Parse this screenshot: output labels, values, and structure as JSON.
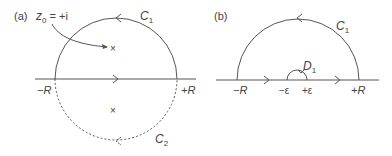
{
  "panel_a": {
    "tag": "(a)",
    "pole_label": "z",
    "pole_sub": "0",
    "pole_value": " = +i",
    "upper_contour": "C",
    "upper_sub": "1",
    "lower_contour": "C",
    "lower_sub": "2",
    "left_end": "−R",
    "right_end": "+R",
    "pole_mark": "×"
  },
  "panel_b": {
    "tag": "(b)",
    "upper_contour": "C",
    "upper_sub": "1",
    "indent_contour": "D",
    "indent_sub": "1",
    "left_end": "−R",
    "right_end": "+R",
    "left_eps": "−ε",
    "right_eps": "+ε"
  },
  "colors": {
    "stroke": "#555555",
    "text": "#444444"
  }
}
